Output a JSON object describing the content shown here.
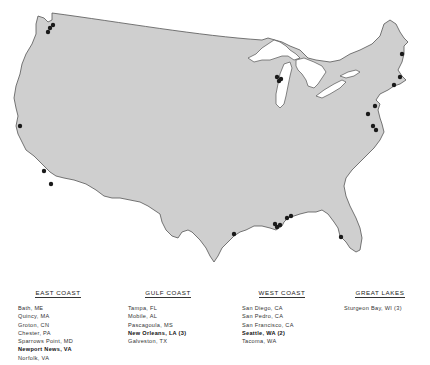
{
  "map": {
    "title": "",
    "land_color": "#cfcfcf",
    "outline_color": "#555555",
    "marker_color": "#1a1a1a",
    "markers": [
      {
        "name": "Seattle, WA",
        "x": 50,
        "y": 28
      },
      {
        "name": "Seattle, WA (2)",
        "x": 53,
        "y": 25
      },
      {
        "name": "Tacoma, WA",
        "x": 48,
        "y": 32
      },
      {
        "name": "San Francisco, CA",
        "x": 20,
        "y": 126
      },
      {
        "name": "San Pedro, CA",
        "x": 44,
        "y": 171
      },
      {
        "name": "San Diego, CA",
        "x": 51,
        "y": 184
      },
      {
        "name": "Sturgeon Bay, WI",
        "x": 277,
        "y": 77
      },
      {
        "name": "Sturgeon Bay, WI (2)",
        "x": 281,
        "y": 79
      },
      {
        "name": "Sturgeon Bay, WI (3)",
        "x": 279,
        "y": 81
      },
      {
        "name": "Bath, ME",
        "x": 402,
        "y": 54
      },
      {
        "name": "Quincy, MA",
        "x": 400,
        "y": 77
      },
      {
        "name": "Groton, CN",
        "x": 394,
        "y": 85
      },
      {
        "name": "Chester, PA",
        "x": 375,
        "y": 106
      },
      {
        "name": "Sparrows Point, MD",
        "x": 368,
        "y": 114
      },
      {
        "name": "Newport News, VA",
        "x": 373,
        "y": 126
      },
      {
        "name": "Norfolk, VA",
        "x": 376,
        "y": 130
      },
      {
        "name": "Galveston, TX",
        "x": 234,
        "y": 234
      },
      {
        "name": "New Orleans, LA",
        "x": 275,
        "y": 224
      },
      {
        "name": "New Orleans, LA (2)",
        "x": 277,
        "y": 227
      },
      {
        "name": "New Orleans, LA (3)",
        "x": 280,
        "y": 225
      },
      {
        "name": "Pascagoula, MS",
        "x": 287,
        "y": 218
      },
      {
        "name": "Mobile, AL",
        "x": 291,
        "y": 216
      },
      {
        "name": "Tampa, FL",
        "x": 341,
        "y": 237
      }
    ]
  },
  "legend": {
    "columns": [
      {
        "title": "EAST COAST",
        "items": [
          {
            "label": "Bath, ME",
            "bold": false
          },
          {
            "label": "Quincy, MA",
            "bold": false
          },
          {
            "label": "Groton, CN",
            "bold": false
          },
          {
            "label": "Chester, PA",
            "bold": false
          },
          {
            "label": "Sparrows Point, MD",
            "bold": false
          },
          {
            "label": "Newport News, VA",
            "bold": true
          },
          {
            "label": "Norfolk, VA",
            "bold": false
          }
        ]
      },
      {
        "title": "GULF COAST",
        "items": [
          {
            "label": "Tampa, FL",
            "bold": false
          },
          {
            "label": "Mobile, AL",
            "bold": false
          },
          {
            "label": "Pascagoula, MS",
            "bold": false
          },
          {
            "label": "New Orleans, LA (3)",
            "bold": true
          },
          {
            "label": "Galveston, TX",
            "bold": false
          }
        ]
      },
      {
        "title": "WEST COAST",
        "items": [
          {
            "label": "San Diego, CA",
            "bold": false
          },
          {
            "label": "San Pedro, CA",
            "bold": false
          },
          {
            "label": "San Francisco, CA",
            "bold": false
          },
          {
            "label": "Seattle, WA (2)",
            "bold": true
          },
          {
            "label": "Tacoma, WA",
            "bold": false
          }
        ]
      },
      {
        "title": "GREAT LAKES",
        "items": [
          {
            "label": "Sturgeon Bay, WI (3)",
            "bold": false
          }
        ]
      }
    ]
  }
}
